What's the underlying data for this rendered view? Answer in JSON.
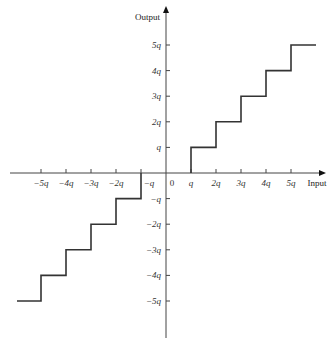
{
  "chart_data": {
    "type": "line",
    "subtype": "step",
    "title": "",
    "xlabel": "Input",
    "ylabel": "Output",
    "origin_label": "0",
    "x_tick_labels": [
      "−5q",
      "−4q",
      "−3q",
      "−2q",
      "−q",
      "q",
      "2q",
      "3q",
      "4q",
      "5q"
    ],
    "x_tick_values": [
      -5,
      -4,
      -3,
      -2,
      -1,
      1,
      2,
      3,
      4,
      5
    ],
    "y_tick_labels": [
      "5q",
      "4q",
      "3q",
      "2q",
      "q",
      "−q",
      "−2q",
      "−3q",
      "−4q",
      "−5q"
    ],
    "y_tick_values": [
      5,
      4,
      3,
      2,
      1,
      -1,
      -2,
      -3,
      -4,
      -5
    ],
    "xlim": [
      -6.2,
      6.4
    ],
    "ylim": [
      -6.5,
      6.8
    ],
    "grid": false,
    "legend": null,
    "series": [
      {
        "name": "quantizer transfer characteristic",
        "points": [
          [
            -6,
            -5
          ],
          [
            -5,
            -5
          ],
          [
            -5,
            -4
          ],
          [
            -4,
            -4
          ],
          [
            -4,
            -3
          ],
          [
            -3,
            -3
          ],
          [
            -3,
            -2
          ],
          [
            -2,
            -2
          ],
          [
            -2,
            -1
          ],
          [
            -1,
            -1
          ],
          [
            -1,
            0
          ],
          [
            1,
            0
          ],
          [
            1,
            1
          ],
          [
            2,
            1
          ],
          [
            2,
            2
          ],
          [
            3,
            2
          ],
          [
            3,
            3
          ],
          [
            4,
            3
          ],
          [
            4,
            4
          ],
          [
            5,
            4
          ],
          [
            5,
            5
          ],
          [
            6,
            5
          ]
        ]
      }
    ]
  },
  "layout": {
    "origin_px": [
      166,
      173
    ],
    "unit_px": [
      25,
      25.6
    ],
    "x_axis_px": [
      10,
      326
    ],
    "y_axis_px": [
      338,
      6
    ],
    "line_color": "#333333",
    "axis_color": "#444444"
  }
}
